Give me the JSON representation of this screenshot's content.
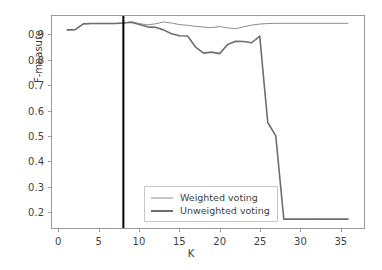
{
  "chart_data": {
    "type": "line",
    "title": "",
    "xlabel": "K",
    "ylabel": "F-measure",
    "xlim": [
      -0.9,
      38.0
    ],
    "ylim": [
      0.135,
      0.975
    ],
    "grid": false,
    "legend_position": "lower center",
    "xticks": [
      0,
      5,
      10,
      15,
      20,
      25,
      30,
      35
    ],
    "xtick_labels": [
      "0",
      "5",
      "10",
      "15",
      "20",
      "25",
      "30",
      "35"
    ],
    "yticks": [
      0.2,
      0.3,
      0.4,
      0.5,
      0.6,
      0.7,
      0.8,
      0.9
    ],
    "ytick_labels": [
      "0.2",
      "0.3",
      "0.4",
      "0.5",
      "0.6",
      "0.7",
      "0.8",
      "0.9"
    ],
    "x": [
      1,
      2,
      3,
      4,
      5,
      6,
      7,
      8,
      9,
      10,
      11,
      12,
      13,
      14,
      15,
      16,
      17,
      18,
      19,
      20,
      21,
      22,
      23,
      24,
      25,
      26,
      27,
      28,
      29,
      30,
      31,
      32,
      33,
      34,
      35,
      36
    ],
    "series": [
      {
        "name": "Weighted voting",
        "color": "#8c8c8c",
        "linewidth": 1,
        "values": [
          0.92,
          0.921,
          0.944,
          0.945,
          0.945,
          0.945,
          0.945,
          0.947,
          0.952,
          0.945,
          0.94,
          0.944,
          0.951,
          0.947,
          0.941,
          0.938,
          0.934,
          0.931,
          0.929,
          0.933,
          0.928,
          0.925,
          0.932,
          0.939,
          0.943,
          0.945,
          0.946,
          0.946,
          0.946,
          0.946,
          0.946,
          0.946,
          0.946,
          0.946,
          0.946,
          0.946
        ]
      },
      {
        "name": "Unweighted voting",
        "color": "#6e6e6e",
        "linewidth": 1.6,
        "values": [
          0.92,
          0.921,
          0.944,
          0.945,
          0.945,
          0.945,
          0.945,
          0.947,
          0.95,
          0.941,
          0.932,
          0.93,
          0.92,
          0.905,
          0.897,
          0.896,
          0.852,
          0.828,
          0.832,
          0.826,
          0.862,
          0.875,
          0.874,
          0.869,
          0.895,
          0.553,
          0.5,
          0.17,
          0.17,
          0.17,
          0.17,
          0.17,
          0.17,
          0.17,
          0.17,
          0.17
        ]
      }
    ],
    "annotations": [
      {
        "type": "vertical-line",
        "name": "selected-k-marker",
        "x": 8,
        "color": "#000000",
        "linewidth": 2
      }
    ]
  }
}
